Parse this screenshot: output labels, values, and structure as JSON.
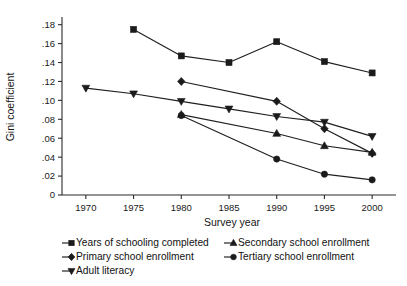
{
  "chart_data": {
    "type": "line",
    "title": "",
    "xlabel": "Survey year",
    "ylabel": "Gini coefficient",
    "x": [
      1970,
      1975,
      1980,
      1985,
      1990,
      1995,
      2000
    ],
    "xtick_labels": [
      "1970",
      "1975",
      "1980",
      "1985",
      "1990",
      "1995",
      "2000"
    ],
    "ytick_labels": [
      "0",
      ".02",
      ".04",
      ".06",
      ".08",
      ".10",
      ".12",
      ".14",
      ".16",
      ".18"
    ],
    "ytick_values": [
      0,
      0.02,
      0.04,
      0.06,
      0.08,
      0.1,
      0.12,
      0.14,
      0.16,
      0.18
    ],
    "xlim": [
      1967.5,
      2002.5
    ],
    "ylim": [
      0,
      0.186
    ],
    "grid": false,
    "legend_position": "below",
    "line_color": "#1f1f1f",
    "series": [
      {
        "name": "Years of schooling completed",
        "marker": "square",
        "x": [
          1975,
          1980,
          1985,
          1990,
          1995,
          2000
        ],
        "values": [
          0.175,
          0.147,
          0.14,
          0.162,
          0.141,
          0.129
        ]
      },
      {
        "name": "Primary school enrollment",
        "marker": "diamond",
        "x": [
          1980,
          1990,
          1995,
          2000
        ],
        "values": [
          0.12,
          0.099,
          0.07,
          0.044
        ]
      },
      {
        "name": "Adult literacy",
        "marker": "triangle-down",
        "x": [
          1970,
          1975,
          1980,
          1985,
          1990,
          1995,
          2000
        ],
        "values": [
          0.113,
          0.107,
          0.099,
          0.091,
          0.083,
          0.077,
          0.062
        ]
      },
      {
        "name": "Secondary school enrollment",
        "marker": "triangle-up",
        "x": [
          1980,
          1990,
          1995,
          2000
        ],
        "values": [
          0.085,
          0.065,
          0.052,
          0.045
        ]
      },
      {
        "name": "Tertiary school enrollment",
        "marker": "circle",
        "x": [
          1980,
          1990,
          1995,
          2000
        ],
        "values": [
          0.084,
          0.038,
          0.022,
          0.016
        ]
      }
    ]
  },
  "legend": {
    "entries": [
      {
        "label": "Years of schooling completed",
        "marker": "square",
        "col": 0,
        "row": 0
      },
      {
        "label": "Secondary school enrollment",
        "marker": "triangle-up",
        "col": 1,
        "row": 0
      },
      {
        "label": "Primary school enrollment",
        "marker": "diamond",
        "col": 0,
        "row": 1
      },
      {
        "label": "Tertiary school enrollment",
        "marker": "circle",
        "col": 1,
        "row": 1
      },
      {
        "label": "Adult literacy",
        "marker": "triangle-down",
        "col": 0,
        "row": 2
      }
    ]
  }
}
